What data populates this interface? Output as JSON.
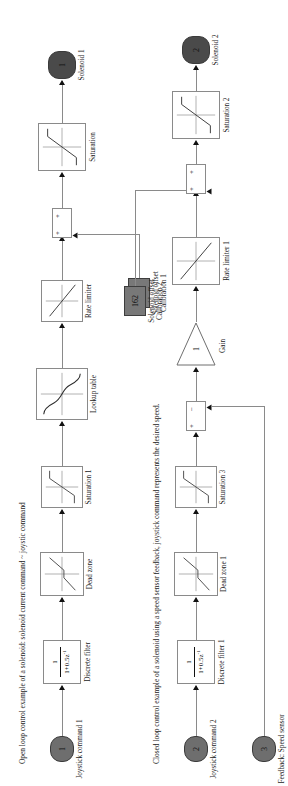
{
  "diagram": {
    "orientation": "rotated-90",
    "captions": {
      "open_loop": "Open loop control example of a solenoid: solenoid current command ~ joystic command",
      "closed_loop": "Closed loop control example of a solenoid using a speed sensor feedback, joystick command represents the desired speed."
    },
    "colors": {
      "port_fill": "#6e6e6e",
      "port_dark_fill": "#4a4a4a",
      "const_fill": "#787878",
      "line": "#8a8a8a",
      "block_border": "#8a8a8a",
      "text": "#1a1a1a"
    },
    "open_loop_chain": {
      "input_port": {
        "number": "1",
        "label": "Joystick command 1"
      },
      "blocks": [
        {
          "name": "discrete-filter",
          "label": "Discrete filter",
          "numerator": "1",
          "denominator": "1+0.5z",
          "exponent": "-1"
        },
        {
          "name": "dead-zone",
          "label": "Dead zone"
        },
        {
          "name": "saturation-1",
          "label": "Saturation 1"
        },
        {
          "name": "lookup-table",
          "label": "Lookup table"
        },
        {
          "name": "rate-limiter",
          "label": "Rate limiter"
        },
        {
          "name": "sum-1",
          "label": "",
          "signs": [
            "+",
            "+"
          ]
        },
        {
          "name": "saturation",
          "label": "Saturation"
        }
      ],
      "constant": {
        "value": "153",
        "label": "Solenoid offset\nCalibration 1"
      },
      "output_port": {
        "number": "1",
        "label": "Solenoid 1"
      }
    },
    "closed_loop_chain": {
      "input_port": {
        "number": "2",
        "label": "Joystick command 2"
      },
      "feedback_port": {
        "number": "3",
        "label": "Feedback: Speed sensor"
      },
      "blocks": [
        {
          "name": "discrete-filter-1",
          "label": "Discrete filter 1",
          "numerator": "1",
          "denominator": "1+0.5z",
          "exponent": "-1"
        },
        {
          "name": "dead-zone-1",
          "label": "Dead zone 1"
        },
        {
          "name": "saturation-3",
          "label": "Saturation 3"
        },
        {
          "name": "sum-error",
          "label": "",
          "signs": [
            "+",
            "−"
          ]
        },
        {
          "name": "gain",
          "label": "Gain",
          "value": "1"
        },
        {
          "name": "rate-limiter-1",
          "label": "Rate limiter 1"
        },
        {
          "name": "sum-2",
          "label": "",
          "signs": [
            "+",
            "+"
          ]
        },
        {
          "name": "saturation-2",
          "label": "Saturation 2"
        }
      ],
      "constant": {
        "value": "162",
        "label": "Solenoid offset\nCalibration 2"
      },
      "output_port": {
        "number": "2",
        "label": "Solenoid 2"
      }
    }
  }
}
